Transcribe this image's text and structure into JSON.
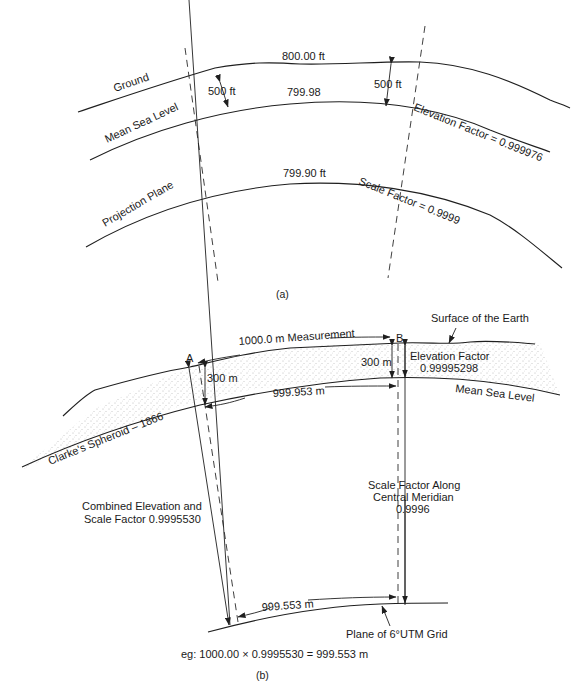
{
  "figure_a": {
    "caption": "(a)",
    "top_value": "800.00 ft",
    "msl_value": "799.98",
    "projection_value": "799.90 ft",
    "ground_label": "Ground",
    "msl_label": "Mean Sea Level",
    "projection_label": "Projection Plane",
    "height_left": "500 ft",
    "height_right": "500 ft",
    "elevation_factor": "Elevation Factor = 0.999976",
    "scale_factor": "Scale Factor = 0.9999"
  },
  "figure_b": {
    "caption": "(b)",
    "measurement": "1000.0 m Measurement",
    "point_a": "A",
    "point_b": "B",
    "surface_label": "Surface of the Earth",
    "height_a": "300 m",
    "height_b": "300 m",
    "elevation_factor_label": "Elevation Factor",
    "elevation_factor_value": "0.99995298",
    "msl_distance": "999.953 m",
    "msl_label": "Mean Sea Level",
    "spheroid_label": "Clarke's Spheroid – 1866",
    "combined_line1": "Combined Elevation and",
    "combined_line2": "Scale Factor 0.9995530",
    "scale_cm_line1": "Scale Factor Along",
    "scale_cm_line2": "Central Meridian",
    "scale_cm_line3": "0.9996",
    "grid_distance": "999.553 m",
    "grid_label": "Plane of 6°UTM Grid",
    "example": "eg:  1000.00 × 0.9995530 = 999.553 m"
  }
}
